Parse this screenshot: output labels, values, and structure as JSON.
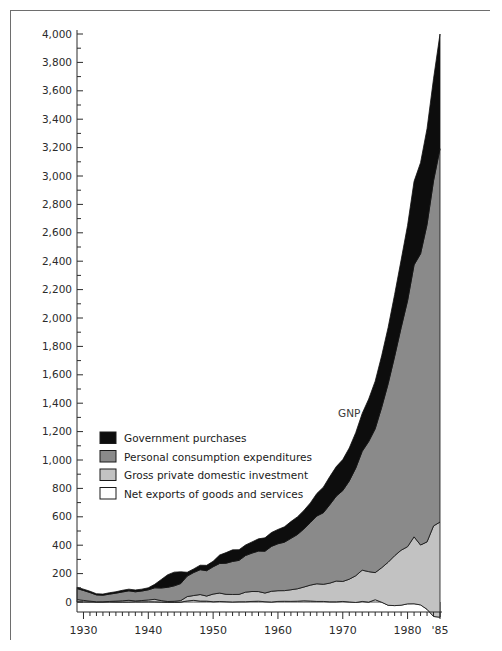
{
  "figure": {
    "ylabel": "Billions of dollars",
    "annotation": "GNP",
    "border_color": "#6e6e6e"
  },
  "legend": {
    "items": [
      {
        "label": "Government purchases",
        "color": "#0d0d0d",
        "key": "government"
      },
      {
        "label": "Personal consumption expenditures",
        "color": "#8a8a8a",
        "key": "personal"
      },
      {
        "label": "Gross private domestic investment",
        "color": "#c2c2c2",
        "key": "investment"
      },
      {
        "label": "Net exports of goods and services",
        "color": "#ffffff",
        "key": "netexports"
      }
    ]
  },
  "chart_data": {
    "type": "area",
    "title": "",
    "subtitle": "",
    "xlabel": "",
    "ylabel": "Billions of dollars",
    "annotations": [
      {
        "text": "GNP",
        "x": 1971,
        "y": 1300
      }
    ],
    "grid": false,
    "legend_position": "inside-left",
    "stacked": true,
    "xlim": [
      1929,
      1985
    ],
    "ylim": [
      0,
      4000
    ],
    "ytick_labels": [
      "0",
      "200",
      "400",
      "600",
      "800",
      "1,000",
      "1,200",
      "1,400",
      "1,600",
      "1,800",
      "2,000",
      "2,200",
      "2,400",
      "2,600",
      "2,800",
      "3,000",
      "3,200",
      "3,400",
      "3,600",
      "3,800",
      "4,000"
    ],
    "ytick_values": [
      0,
      200,
      400,
      600,
      800,
      1000,
      1200,
      1400,
      1600,
      1800,
      2000,
      2200,
      2400,
      2600,
      2800,
      3000,
      3200,
      3400,
      3600,
      3800,
      4000
    ],
    "ytick_minor_step": 100,
    "xtick_labels": [
      "1930",
      "1940",
      "1950",
      "1960",
      "1970",
      "1980",
      "'85"
    ],
    "xtick_values": [
      1930,
      1940,
      1950,
      1960,
      1970,
      1980,
      1985
    ],
    "xtick_minor_step": 1,
    "x": [
      1929,
      1930,
      1931,
      1932,
      1933,
      1934,
      1935,
      1936,
      1937,
      1938,
      1939,
      1940,
      1941,
      1942,
      1943,
      1944,
      1945,
      1946,
      1947,
      1948,
      1949,
      1950,
      1951,
      1952,
      1953,
      1954,
      1955,
      1956,
      1957,
      1958,
      1959,
      1960,
      1961,
      1962,
      1963,
      1964,
      1965,
      1966,
      1967,
      1968,
      1969,
      1970,
      1971,
      1972,
      1973,
      1974,
      1975,
      1976,
      1977,
      1978,
      1979,
      1980,
      1981,
      1982,
      1983,
      1984,
      1985
    ],
    "series": [
      {
        "name": "Net exports of goods and services",
        "key": "netexports",
        "color": "#ffffff",
        "values": [
          1.1,
          1.0,
          0.5,
          0.4,
          0.4,
          0.6,
          -0.1,
          -0.1,
          0.1,
          1.1,
          0.9,
          1.5,
          1.0,
          -0.2,
          -2.2,
          -2.1,
          -0.8,
          7.5,
          11.6,
          6.5,
          6.2,
          1.8,
          3.7,
          2.2,
          0.4,
          1.8,
          2.0,
          4.0,
          5.7,
          2.2,
          0.1,
          4.1,
          5.0,
          4.3,
          5.6,
          8.5,
          6.9,
          3.9,
          3.9,
          1.4,
          1.4,
          3.9,
          0.6,
          -3.4,
          4.1,
          -0.8,
          16.0,
          -1.6,
          -23.1,
          -25.4,
          -22.5,
          -13.1,
          -12.5,
          -20.5,
          -51.4,
          -102.0,
          -107.0
        ]
      },
      {
        "name": "Gross private domestic investment",
        "key": "investment",
        "color": "#c2c2c2",
        "values": [
          16.2,
          10.3,
          5.5,
          0.9,
          1.4,
          3.3,
          6.4,
          8.5,
          11.8,
          6.5,
          9.3,
          13.1,
          17.9,
          9.9,
          5.8,
          7.2,
          10.6,
          30.7,
          34.0,
          46.0,
          35.7,
          54.1,
          59.3,
          51.9,
          52.6,
          51.7,
          67.4,
          70.0,
          67.8,
          60.9,
          75.3,
          75.5,
          75.0,
          81.9,
          87.6,
          96.9,
          112.0,
          124.5,
          120.8,
          131.5,
          146.2,
          140.8,
          160.0,
          188.3,
          220.2,
          214.6,
          190.9,
          243.0,
          303.1,
          351.5,
          387.2,
          402.8,
          471.5,
          421.9,
          474.9,
          637.8,
          670.0
        ]
      },
      {
        "name": "Personal consumption expenditures",
        "key": "personal",
        "color": "#8a8a8a",
        "values": [
          77.4,
          70.1,
          60.7,
          48.7,
          45.9,
          51.5,
          55.9,
          62.2,
          66.8,
          64.3,
          67.2,
          71.3,
          81.1,
          89.0,
          99.9,
          108.7,
          120.0,
          144.3,
          162.0,
          175.0,
          178.5,
          192.1,
          208.1,
          219.1,
          232.6,
          239.8,
          257.9,
          270.6,
          285.3,
          294.6,
          316.3,
          330.7,
          341.1,
          361.9,
          381.7,
          409.3,
          440.7,
          477.3,
          503.6,
          552.5,
          597.9,
          640.0,
          691.6,
          757.6,
          837.2,
          916.5,
          1012.8,
          1129.3,
          1257.2,
          1403.5,
          1566.8,
          1732.6,
          1915.1,
          2050.7,
          2234.5,
          2430.5,
          2629.0
        ]
      },
      {
        "name": "Government purchases",
        "key": "government",
        "color": "#0d0d0d",
        "values": [
          8.8,
          9.2,
          9.2,
          8.1,
          8.0,
          9.8,
          10.0,
          11.8,
          11.7,
          12.8,
          13.1,
          14.0,
          24.8,
          59.7,
          88.6,
          96.5,
          82.9,
          27.0,
          25.5,
          31.6,
          37.8,
          38.8,
          59.5,
          74.7,
          81.6,
          74.8,
          74.2,
          78.6,
          86.1,
          94.2,
          97.6,
          100.6,
          108.3,
          118.2,
          124.5,
          130.1,
          138.4,
          158.6,
          180.2,
          198.0,
          207.9,
          218.2,
          232.4,
          250.0,
          266.5,
          299.1,
          335.0,
          362.9,
          396.2,
          435.7,
          476.4,
          530.3,
          588.1,
          641.7,
          675.0,
          718.0,
          808.0
        ]
      }
    ],
    "gnp_total": [
      103.6,
      90.7,
      76.1,
      58.3,
      55.8,
      65.3,
      72.5,
      82.7,
      90.8,
      85.2,
      91.1,
      100.6,
      125.8,
      159.1,
      192.7,
      211.4,
      213.4,
      212.4,
      235.2,
      261.6,
      260.4,
      288.3,
      333.4,
      351.6,
      371.6,
      372.5,
      405.9,
      428.2,
      451.0,
      456.8,
      495.8,
      515.3,
      533.8,
      574.6,
      606.9,
      649.8,
      705.1,
      772.0,
      816.4,
      892.7,
      963.9,
      982.4,
      1063.4,
      1171.1,
      1306.6,
      1412.9,
      1528.8,
      1700.1,
      1887.2,
      2167.4,
      2413.9,
      2627.4,
      2957.8,
      3069.3,
      3304.8,
      3772.2,
      4010.0
    ]
  }
}
